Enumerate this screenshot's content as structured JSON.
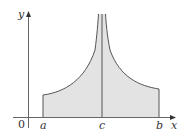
{
  "diagram": {
    "type": "improper-integral-area",
    "labels": {
      "y_axis": "y",
      "x_axis": "x",
      "origin": "0",
      "a": "a",
      "c": "c",
      "b": "b"
    },
    "colors": {
      "fill": "#e3e3e3",
      "stroke": "#555555",
      "axis": "#666666"
    }
  }
}
